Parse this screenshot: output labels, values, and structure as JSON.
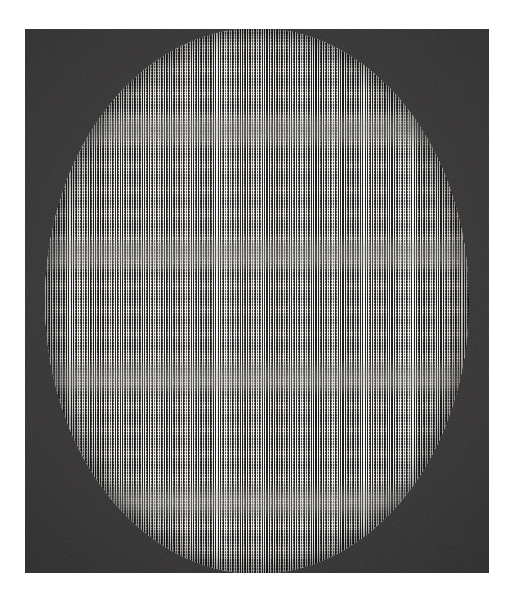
{
  "canvas": {
    "width": 514,
    "height": 601,
    "background_color": "#ffffff",
    "description": "Scanned halftone plate showing a large elliptical moire interference figure on a dark field"
  },
  "panel": {
    "name": "dark-plate",
    "left": 25,
    "top": 29,
    "width": 464,
    "height": 544,
    "background_color": "#2e2c2c",
    "border_color": "#1a1818"
  },
  "figure": {
    "name": "moire-sphere",
    "shape": "ellipse",
    "center_x": 257,
    "center_y": 301,
    "radius_x": 212,
    "radius_y": 273,
    "base_color": "#8e8c8a",
    "highlight_color": "#f2f0ee",
    "shadow_color": "#121111",
    "band_color": "#96948f"
  },
  "pattern": {
    "type": "moire-interference",
    "carrier_vertical_period_px": 2.45,
    "carrier_vertical_period_2_px": 2.72,
    "carrier_horizontal_period_px": 2.9,
    "beat_node_spacing_x_px": 36,
    "beat_node_spacing_y_px": 24,
    "node_band_spacing_y_px": 124,
    "node_shape": "bowtie-lozenge",
    "edge_behaviour": "compressed-toward-limb"
  },
  "margins": {
    "top_px": 29,
    "left_px": 25,
    "right_px": 25,
    "bottom_px": 28,
    "color": "#ffffff"
  }
}
